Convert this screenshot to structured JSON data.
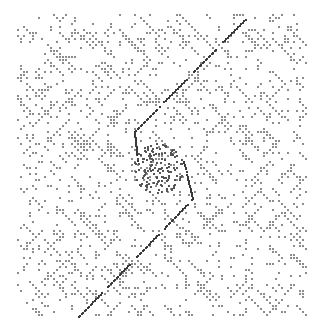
{
  "chart_data": {
    "type": "scatter",
    "subtype": "dot-plot (sequence self-similarity matrix)",
    "title": "",
    "xlabel": "",
    "ylabel": "",
    "grid": false,
    "legend": null,
    "plot_area_px": {
      "x0": 17,
      "y0": 14,
      "x1": 308,
      "y1": 316
    },
    "background_dots": {
      "color": "#8c8c8c",
      "size_px": 2,
      "density": 0.13,
      "cell_px": 3,
      "seed": 20240607
    },
    "main_diagonal": {
      "color": "#3a3a3a",
      "segments": [
        {
          "from": [
            78,
            316
          ],
          "to": [
            192,
            198
          ]
        },
        {
          "from": [
            192,
            198
          ],
          "to": [
            183,
            160
          ]
        },
        {
          "from": [
            134,
            131
          ],
          "to": [
            248,
            15
          ]
        },
        {
          "from": [
            134,
            131
          ],
          "to": [
            137,
            160
          ]
        }
      ]
    },
    "central_cluster": {
      "center": [
        158,
        168
      ],
      "radius": 25,
      "color": "#555555"
    }
  },
  "caption": {
    "text": "",
    "note": "caption line cropped at bottom edge; text not legible"
  }
}
